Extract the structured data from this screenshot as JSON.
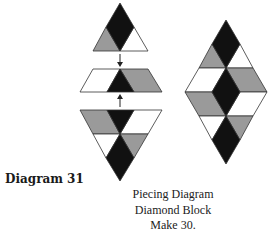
{
  "diagram": {
    "label": "Diagram 31",
    "caption": {
      "line1": "Piecing Diagram",
      "line2": "Diamond Block",
      "line3": "Make 30."
    },
    "colors": {
      "dark": "#111111",
      "medium": "#9a9a9a",
      "light": "#ffffff",
      "outline": "#333333"
    },
    "pieces": {
      "top_unit": "Triangle unit: black diamond center, gray left, white right",
      "middle_unit": "Trapezoid unit: white left, black triangle center, gray right",
      "bottom_unit": "Inverted triangle unit: gray/black/white top row, white/black/gray bottom",
      "finished_block": "Diamond block assembled from three units"
    },
    "arrows": [
      "down-arrow",
      "up-arrow"
    ]
  }
}
